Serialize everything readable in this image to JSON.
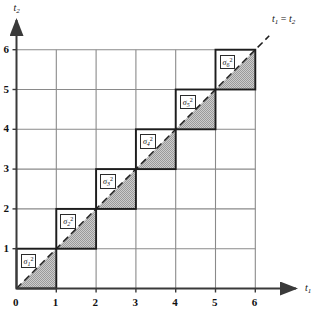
{
  "figure": {
    "type": "math-diagram",
    "axes": {
      "x": {
        "name": "t",
        "name_sub": "1",
        "ticks": [
          "0",
          "1",
          "2",
          "3",
          "4",
          "5",
          "6"
        ],
        "min": 0,
        "max": 6,
        "arrow": true
      },
      "y": {
        "name": "t",
        "name_sub": "2",
        "ticks": [
          "0",
          "1",
          "2",
          "3",
          "4",
          "5",
          "6"
        ],
        "min": 0,
        "max": 6,
        "arrow": true
      }
    },
    "diagonal_line": {
      "label_lhs": "t",
      "label_lhs_sub": "1",
      "label_eq": "=",
      "label_rhs": "t",
      "label_rhs_sub": "2",
      "style": "dashed",
      "from": [
        0,
        0
      ],
      "to": [
        6.35,
        6.35
      ]
    },
    "grid": {
      "rows": 6,
      "cols": 6,
      "line_color": "#8a8a8a",
      "axis_color": "#3a3a3a",
      "show": true
    },
    "cells": [
      {
        "index": 1,
        "sym": "σ",
        "sub": "1",
        "sup": "2",
        "x": 0,
        "y": 0
      },
      {
        "index": 2,
        "sym": "σ",
        "sub": "2",
        "sup": "2",
        "x": 1,
        "y": 1
      },
      {
        "index": 3,
        "sym": "σ",
        "sub": "3",
        "sup": "2",
        "x": 2,
        "y": 2
      },
      {
        "index": 4,
        "sym": "σ",
        "sub": "4",
        "sup": "2",
        "x": 3,
        "y": 3
      },
      {
        "index": 5,
        "sym": "σ",
        "sub": "5",
        "sup": "2",
        "x": 4,
        "y": 4
      },
      {
        "index": 6,
        "sym": "σ",
        "sub": "6",
        "sup": "2",
        "x": 5,
        "y": 5
      }
    ],
    "colors": {
      "shade_fill": "#b4b4b4",
      "cell_outline": "#1d1d1d",
      "grid_line": "#8a8a8a",
      "axis": "#3a3a3a",
      "text": "#111111",
      "background": "#ffffff"
    }
  }
}
